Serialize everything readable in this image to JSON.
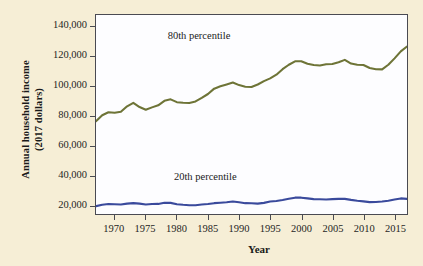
{
  "chart_data": {
    "type": "line",
    "title": "",
    "xlabel": "Year",
    "ylabel": "Annual household income (2017 dollars)",
    "ylabel_line1": "Annual household income",
    "ylabel_line2": "(2017 dollars)",
    "xlim": [
      1967,
      2017
    ],
    "ylim": [
      14000,
      148000
    ],
    "grid": false,
    "legend_position": "inline-annotation",
    "yticks": [
      20000,
      40000,
      60000,
      80000,
      100000,
      120000,
      140000
    ],
    "ytick_labels": [
      "20,000",
      "40,000",
      "60,000",
      "80,000",
      "100,000",
      "120,000",
      "140,000"
    ],
    "xticks": [
      1970,
      1975,
      1980,
      1985,
      1990,
      1995,
      2000,
      2005,
      2010,
      2015
    ],
    "xtick_labels": [
      "1970",
      "1975",
      "1980",
      "1985",
      "1990",
      "1995",
      "2000",
      "2005",
      "2010",
      "2015"
    ],
    "x": [
      1967,
      1968,
      1969,
      1970,
      1971,
      1972,
      1973,
      1974,
      1975,
      1976,
      1977,
      1978,
      1979,
      1980,
      1981,
      1982,
      1983,
      1984,
      1985,
      1986,
      1987,
      1988,
      1989,
      1990,
      1991,
      1992,
      1993,
      1994,
      1995,
      1996,
      1997,
      1998,
      1999,
      2000,
      2001,
      2002,
      2003,
      2004,
      2005,
      2006,
      2007,
      2008,
      2009,
      2010,
      2011,
      2012,
      2013,
      2014,
      2015,
      2016,
      2017
    ],
    "series": [
      {
        "name": "80th percentile",
        "color": "#6e7437",
        "values": [
          76500,
          80500,
          82500,
          82200,
          82800,
          86500,
          88800,
          86000,
          84200,
          85800,
          87200,
          90200,
          91200,
          89300,
          88900,
          88700,
          89800,
          92200,
          94800,
          98400,
          100000,
          101200,
          102500,
          100800,
          99700,
          99500,
          101200,
          103500,
          105300,
          107800,
          111500,
          114500,
          116800,
          116900,
          115200,
          114300,
          114000,
          114800,
          115000,
          116200,
          117800,
          115300,
          114500,
          114300,
          112300,
          111500,
          111400,
          114500,
          118800,
          123500,
          126800
        ]
      },
      {
        "name": "20th percentile",
        "color": "#3a4a9c",
        "values": [
          19300,
          20200,
          20700,
          20600,
          20400,
          21000,
          21300,
          21000,
          20400,
          20700,
          20800,
          21600,
          21500,
          20600,
          20200,
          19900,
          19900,
          20400,
          20700,
          21300,
          21600,
          21900,
          22400,
          21900,
          21300,
          21200,
          21000,
          21500,
          22400,
          22800,
          23400,
          24200,
          25000,
          25000,
          24500,
          24000,
          23900,
          23800,
          24000,
          24200,
          24200,
          23500,
          22900,
          22500,
          22000,
          22100,
          22400,
          22900,
          23800,
          24500,
          24200
        ]
      }
    ],
    "annotations": [
      {
        "text": "80th percentile",
        "x": 1985,
        "y": 133000
      },
      {
        "text": "20th percentile",
        "x": 1986,
        "y": 39000
      }
    ]
  },
  "style": {
    "page_background": "#f6eed6",
    "plot_background": "#fdfdff",
    "frame_color": "#4a4a52",
    "text_color": "#1a1a1a"
  }
}
